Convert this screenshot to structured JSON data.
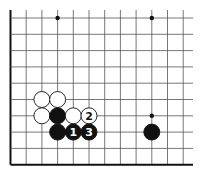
{
  "diagram": {
    "type": "go-board-fragment",
    "grid": {
      "cols": 12,
      "rows": 10,
      "origin_x": 10.5,
      "origin_y": 18,
      "step_x": 15.7,
      "step_y": 16.3,
      "right_edge_x": 193,
      "left_edge_thick": true,
      "bottom_edge_thick": true,
      "line_color": "#555555",
      "edge_color": "#111111"
    },
    "star_points": [
      {
        "col": 3,
        "row": 0
      },
      {
        "col": 9,
        "row": 0
      },
      {
        "col": 9,
        "row": 6
      }
    ],
    "stones": [
      {
        "color": "white",
        "col": 2,
        "row": 5,
        "label": ""
      },
      {
        "color": "white",
        "col": 3,
        "row": 5,
        "label": ""
      },
      {
        "color": "white",
        "col": 2,
        "row": 6,
        "label": ""
      },
      {
        "color": "black",
        "col": 3,
        "row": 6,
        "label": ""
      },
      {
        "color": "white",
        "col": 4,
        "row": 6,
        "label": ""
      },
      {
        "color": "white",
        "col": 5,
        "row": 6,
        "label": "2"
      },
      {
        "color": "black",
        "col": 3,
        "row": 7,
        "label": ""
      },
      {
        "color": "black",
        "col": 4,
        "row": 7,
        "label": "1"
      },
      {
        "color": "black",
        "col": 5,
        "row": 7,
        "label": "3"
      },
      {
        "color": "black",
        "col": 9,
        "row": 7,
        "label": ""
      }
    ],
    "stone_radius": 8,
    "colors": {
      "black_stone": "#111111",
      "white_stone": "#ffffff",
      "stone_outline": "#111111"
    }
  }
}
